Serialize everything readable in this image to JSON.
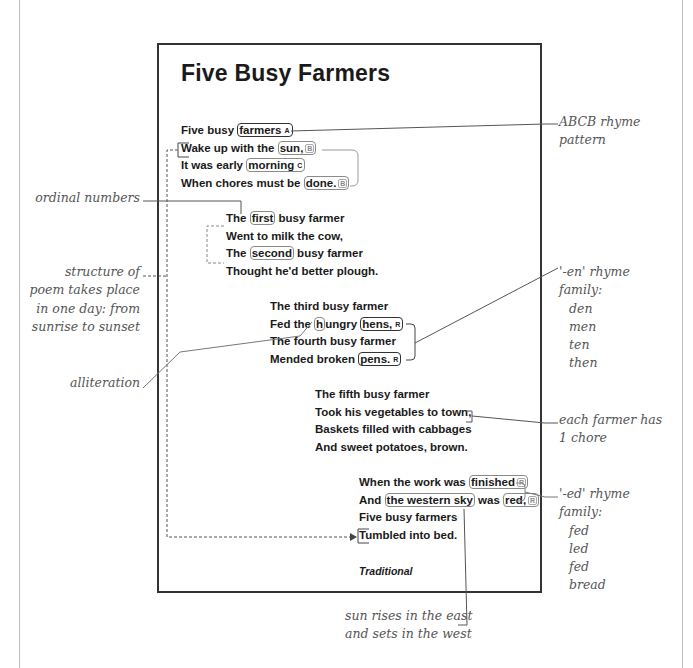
{
  "poem": {
    "title": "Five Busy Farmers",
    "stanzas": [
      {
        "lines": [
          {
            "pre": "Five busy ",
            "hl": "farmers",
            "tag": "A",
            "post": ""
          },
          {
            "pre": "Wake up with the ",
            "hl": "sun,",
            "tag": "B",
            "post": ""
          },
          {
            "pre": "It was early ",
            "hl": "morning",
            "tag": "C",
            "post": ""
          },
          {
            "pre": "When chores must be ",
            "hl": "done.",
            "tag": "B",
            "post": ""
          }
        ]
      },
      {
        "lines": [
          {
            "pre": "The ",
            "hl": "first",
            "post": " busy farmer"
          },
          {
            "text": "Went to milk the cow,"
          },
          {
            "pre": "The ",
            "hl": "second",
            "post": " busy farmer"
          },
          {
            "text": "Thought he'd better plough."
          }
        ]
      },
      {
        "lines": [
          {
            "text": "The third busy farmer"
          },
          {
            "pre": "Fed the ",
            "hl1": "h",
            "mid": "ungry ",
            "hl2": "h",
            "post2": "ens,",
            "tag": "R"
          },
          {
            "text": "The fourth busy farmer"
          },
          {
            "pre": "Mended broken ",
            "hl": "pens.",
            "tag": "R"
          }
        ]
      },
      {
        "lines": [
          {
            "text": "The fifth busy farmer"
          },
          {
            "text": "Took his vegetables to town,"
          },
          {
            "text": "Baskets filled with cabbages"
          },
          {
            "text": "And sweet potatoes, brown."
          }
        ]
      },
      {
        "lines": [
          {
            "pre": "When the work was ",
            "hl": "finished",
            "tag": "R"
          },
          {
            "pre": "And ",
            "hl": "the western sky",
            "mid": " was ",
            "hl2": "red,",
            "tag": "R"
          },
          {
            "text": "Five busy farmers"
          },
          {
            "text": "Tumbled into bed."
          }
        ]
      }
    ],
    "credit": "Traditional"
  },
  "annotations": {
    "rhyme_pattern": [
      "ABCB rhyme",
      "pattern"
    ],
    "ordinal_numbers": "ordinal numbers",
    "structure": [
      "structure of",
      "poem takes place",
      "in one day: from",
      "sunrise to sunset"
    ],
    "alliteration": "alliteration",
    "en_family": {
      "title": "'-en' rhyme",
      "subtitle": "family:",
      "words": [
        "den",
        "men",
        "ten",
        "then"
      ]
    },
    "one_chore": [
      "each farmer has",
      "1 chore"
    ],
    "ed_family": {
      "title": "'-ed' rhyme",
      "subtitle": "family:",
      "words": [
        "fed",
        "led",
        "fed",
        "bread"
      ]
    },
    "sun_east_west": [
      "sun rises in the east",
      "and sets in the west"
    ]
  },
  "colors": {
    "text": "#1a1a1a",
    "annotation": "#555555",
    "border": "#333333",
    "highlight_border": "#8a8a8a"
  }
}
